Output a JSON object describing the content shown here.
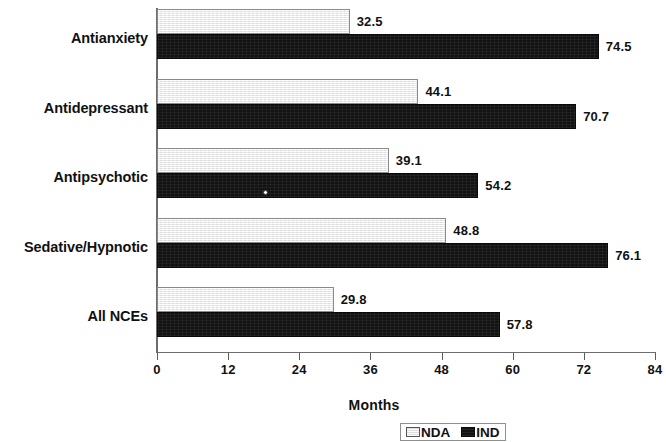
{
  "chart_data": {
    "type": "bar",
    "orientation": "horizontal",
    "title": "",
    "xlabel": "Months",
    "ylabel": "",
    "xlim": [
      0,
      84
    ],
    "xticks": [
      0,
      12,
      24,
      36,
      48,
      60,
      72,
      84
    ],
    "xtick_labels": [
      "0",
      "12",
      "24",
      "36",
      "48",
      "60",
      "72",
      "84"
    ],
    "grid": false,
    "legend_position": "bottom",
    "categories": [
      "Antianxiety",
      "Antidepressant",
      "Antipsychotic",
      "Sedative/Hypnotic",
      "All NCEs"
    ],
    "series": [
      {
        "name": "NDA",
        "color": "#e9e9e9",
        "values": [
          32.5,
          44.1,
          39.1,
          48.8,
          29.8
        ],
        "value_labels": [
          "32.5",
          "44.1",
          "39.1",
          "48.8",
          "29.8"
        ]
      },
      {
        "name": "IND",
        "color": "#121212",
        "values": [
          74.5,
          70.7,
          54.2,
          76.1,
          57.8
        ],
        "value_labels": [
          "74.5",
          "70.7",
          "54.2",
          "76.1",
          "57.8"
        ]
      }
    ]
  },
  "legend": {
    "items": [
      {
        "label": "NDA",
        "swatch": "nda"
      },
      {
        "label": "IND",
        "swatch": "ind"
      }
    ]
  },
  "axis": {
    "x_title": "Months"
  }
}
